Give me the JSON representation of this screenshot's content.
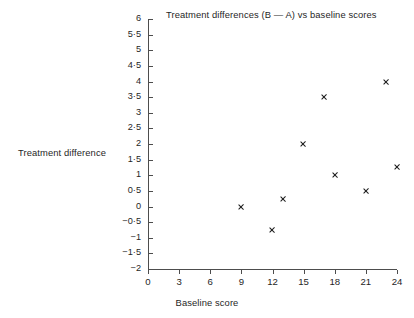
{
  "chart_data": {
    "type": "scatter",
    "title": "Treatment differences (B — A) vs baseline scores",
    "xlabel": "Baseline score",
    "ylabel": "Treatment difference",
    "xlim": [
      0,
      24
    ],
    "ylim": [
      -2,
      6
    ],
    "grid": false,
    "legend": false,
    "marker": "x",
    "marker_color": "#1a1a1a",
    "x_ticks": [
      0,
      3,
      6,
      9,
      12,
      15,
      18,
      21,
      24
    ],
    "x_tick_labels": [
      "0",
      "3",
      "6",
      "9",
      "12",
      "15",
      "18",
      "21",
      "24"
    ],
    "y_ticks": [
      6,
      5.5,
      5,
      4.5,
      4,
      3.5,
      3,
      2.5,
      2,
      1.5,
      1,
      0.5,
      0,
      -0.5,
      -1,
      -1.5,
      -2
    ],
    "y_tick_labels": [
      "6",
      "5·5",
      "5",
      "4·5",
      "4",
      "3·5",
      "3",
      "2·5",
      "2",
      "1·5",
      "1",
      "0·5",
      "0",
      "−0·5",
      "−1",
      "−1·5",
      "−2"
    ],
    "points": [
      {
        "x": 9,
        "y": 0.0
      },
      {
        "x": 12,
        "y": -0.75
      },
      {
        "x": 13,
        "y": 0.25
      },
      {
        "x": 15,
        "y": 2.0
      },
      {
        "x": 17,
        "y": 3.5
      },
      {
        "x": 18,
        "y": 1.0
      },
      {
        "x": 21,
        "y": 0.5
      },
      {
        "x": 23,
        "y": 4.0
      },
      {
        "x": 24,
        "y": 1.25
      }
    ]
  }
}
